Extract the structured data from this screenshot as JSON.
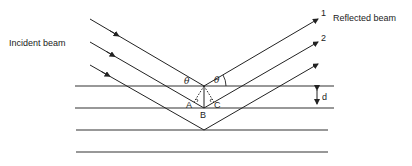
{
  "diagram": {
    "labels": {
      "incident": "Incident beam",
      "reflected": "Reflected beam",
      "ray1": "1",
      "ray2": "2",
      "theta_left": "θ",
      "theta_right": "θ",
      "point_a": "A",
      "point_b": "B",
      "point_c": "C",
      "spacing": "d"
    },
    "planes_y": [
      86,
      108,
      130,
      152
    ],
    "colors": {
      "line": "#222222",
      "background": "#ffffff"
    }
  }
}
